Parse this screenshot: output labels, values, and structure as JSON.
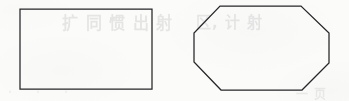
{
  "figure": {
    "caption": "",
    "background_color": "#fbfbfa",
    "stroke_color": "#262628",
    "width": 349,
    "height": 101
  },
  "ghost_text": {
    "line_1": "扩 同 惯 出 射",
    "line_2": "区, 计 射",
    "line_3": "一 页",
    "line_4": "· · ·"
  },
  "chart_data": {
    "type": "diagram",
    "title": "",
    "subtitle": "",
    "xlabel": "",
    "ylabel": "",
    "legend": [],
    "grid": false,
    "shapes": [
      {
        "name": "rectangle",
        "label": "",
        "kind": "polygon",
        "sides": 4,
        "fill": "none",
        "stroke": "#262628",
        "stroke_width": 1.25,
        "bbox": {
          "x": 20,
          "y": 9,
          "width": 132,
          "height": 80
        },
        "points": "20,9 152,9 152,89 20,89"
      },
      {
        "name": "octagon",
        "label": "",
        "kind": "polygon",
        "sides": 8,
        "fill": "none",
        "stroke": "#262628",
        "stroke_width": 1.25,
        "bbox": {
          "x": 194,
          "y": 6,
          "width": 136,
          "height": 84
        },
        "points": "220,6 301,6 329,33 329,63 302,90 221,90 194,62 194,33"
      }
    ]
  }
}
